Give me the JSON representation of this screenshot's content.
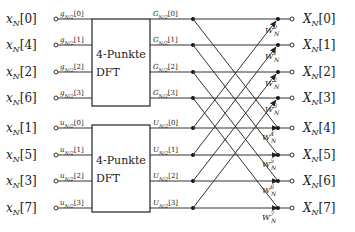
{
  "diagram": {
    "inputs": [
      "x_N[0]",
      "x_N[4]",
      "x_N[2]",
      "x_N[6]",
      "x_N[1]",
      "x_N[5]",
      "x_N[3]",
      "x_N[7]"
    ],
    "input_labels": [
      {
        "base": "x",
        "sub": "N",
        "idx": "[0]"
      },
      {
        "base": "x",
        "sub": "N",
        "idx": "[4]"
      },
      {
        "base": "x",
        "sub": "N",
        "idx": "[2]"
      },
      {
        "base": "x",
        "sub": "N",
        "idx": "[6]"
      },
      {
        "base": "x",
        "sub": "N",
        "idx": "[1]"
      },
      {
        "base": "x",
        "sub": "N",
        "idx": "[5]"
      },
      {
        "base": "x",
        "sub": "N",
        "idx": "[3]"
      },
      {
        "base": "x",
        "sub": "N",
        "idx": "[7]"
      }
    ],
    "box_inputs": [
      {
        "base": "g",
        "sub": "N/2",
        "idx": "[0]"
      },
      {
        "base": "g",
        "sub": "N/2",
        "idx": "[1]"
      },
      {
        "base": "g",
        "sub": "N/2",
        "idx": "[2]"
      },
      {
        "base": "g",
        "sub": "N/2",
        "idx": "[3]"
      },
      {
        "base": "u",
        "sub": "N/2",
        "idx": "[0]"
      },
      {
        "base": "u",
        "sub": "N/2",
        "idx": "[1]"
      },
      {
        "base": "u",
        "sub": "N/2",
        "idx": "[2]"
      },
      {
        "base": "u",
        "sub": "N/2",
        "idx": "[3]"
      }
    ],
    "box_outputs": [
      {
        "base": "G",
        "sub": "N/2",
        "idx": "[0]"
      },
      {
        "base": "G",
        "sub": "N/2",
        "idx": "[1]"
      },
      {
        "base": "G",
        "sub": "N/2",
        "idx": "[2]"
      },
      {
        "base": "G",
        "sub": "N/2",
        "idx": "[3]"
      },
      {
        "base": "U",
        "sub": "N/2",
        "idx": "[0]"
      },
      {
        "base": "U",
        "sub": "N/2",
        "idx": "[1]"
      },
      {
        "base": "U",
        "sub": "N/2",
        "idx": "[2]"
      },
      {
        "base": "U",
        "sub": "N/2",
        "idx": "[3]"
      }
    ],
    "blocks": [
      {
        "line1": "4-Punkte",
        "line2": "DFT"
      },
      {
        "line1": "4-Punkte",
        "line2": "DFT"
      }
    ],
    "twiddles": [
      {
        "base": "W",
        "sup": "0",
        "sub": "N"
      },
      {
        "base": "W",
        "sup": "1",
        "sub": "N"
      },
      {
        "base": "W",
        "sup": "2",
        "sub": "N"
      },
      {
        "base": "W",
        "sup": "3",
        "sub": "N"
      },
      {
        "base": "W",
        "sup": "4",
        "sub": "N"
      },
      {
        "base": "W",
        "sup": "5",
        "sub": "N"
      },
      {
        "base": "W",
        "sup": "6",
        "sub": "N"
      },
      {
        "base": "W",
        "sup": "7",
        "sub": "N"
      }
    ],
    "outputs": [
      {
        "base": "X",
        "sub": "N",
        "idx": "[0]"
      },
      {
        "base": "X",
        "sub": "N",
        "idx": "[1]"
      },
      {
        "base": "X",
        "sub": "N",
        "idx": "[2]"
      },
      {
        "base": "X",
        "sub": "N",
        "idx": "[3]"
      },
      {
        "base": "X",
        "sub": "N",
        "idx": "[4]"
      },
      {
        "base": "X",
        "sub": "N",
        "idx": "[5]"
      },
      {
        "base": "X",
        "sub": "N",
        "idx": "[6]"
      },
      {
        "base": "X",
        "sub": "N",
        "idx": "[7]"
      }
    ],
    "colors": {
      "line": "#333333",
      "text": "#222222",
      "background": "#ffffff"
    }
  }
}
